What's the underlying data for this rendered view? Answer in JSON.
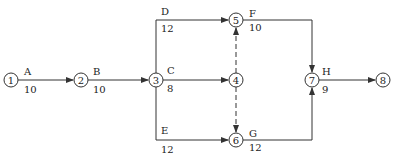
{
  "diagram": {
    "type": "activity-on-arrow network",
    "colors": {
      "line": "#333333",
      "text": "#222222",
      "background": "#ffffff"
    },
    "nodes": [
      {
        "id": "1",
        "label": "1",
        "x": 11,
        "y": 80
      },
      {
        "id": "2",
        "label": "2",
        "x": 81,
        "y": 80
      },
      {
        "id": "3",
        "label": "3",
        "x": 156,
        "y": 80
      },
      {
        "id": "4",
        "label": "4",
        "x": 236,
        "y": 80
      },
      {
        "id": "5",
        "label": "5",
        "x": 236,
        "y": 20
      },
      {
        "id": "6",
        "label": "6",
        "x": 236,
        "y": 140
      },
      {
        "id": "7",
        "label": "7",
        "x": 312,
        "y": 80
      },
      {
        "id": "8",
        "label": "8",
        "x": 383,
        "y": 80
      }
    ],
    "activities": [
      {
        "name": "A",
        "duration": "10",
        "from": "1",
        "to": "2"
      },
      {
        "name": "B",
        "duration": "10",
        "from": "2",
        "to": "3"
      },
      {
        "name": "C",
        "duration": "8",
        "from": "3",
        "to": "4"
      },
      {
        "name": "D",
        "duration": "12",
        "from": "3",
        "to": "5"
      },
      {
        "name": "E",
        "duration": "12",
        "from": "3",
        "to": "6"
      },
      {
        "name": "F",
        "duration": "10",
        "from": "5",
        "to": "7"
      },
      {
        "name": "G",
        "duration": "12",
        "from": "6",
        "to": "7"
      },
      {
        "name": "H",
        "duration": "9",
        "from": "7",
        "to": "8"
      }
    ],
    "dummies": [
      {
        "from": "4",
        "to": "5"
      },
      {
        "from": "4",
        "to": "6"
      }
    ]
  }
}
